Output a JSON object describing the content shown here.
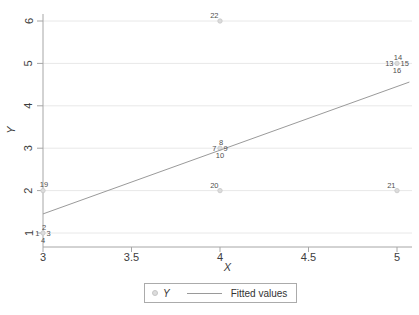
{
  "chart_data": {
    "type": "scatter",
    "title": "",
    "xlabel": "X",
    "ylabel": "Y",
    "x_ticks": [
      3,
      3.5,
      4,
      4.5,
      5
    ],
    "y_ticks": [
      1,
      2,
      3,
      4,
      5,
      6
    ],
    "xlim": [
      3,
      5.09
    ],
    "ylim": [
      0.67,
      6.17
    ],
    "grid": "horizontal-only",
    "legend": {
      "position": "bottom-center",
      "marker_label": "Y",
      "line_label": "Fitted values"
    },
    "points": [
      {
        "label": "1",
        "x": 3,
        "y": 1,
        "label_pos": "left"
      },
      {
        "label": "2",
        "x": 3,
        "y": 1,
        "label_pos": "top"
      },
      {
        "label": "3",
        "x": 3,
        "y": 1,
        "label_pos": "right"
      },
      {
        "label": "4",
        "x": 3,
        "y": 1,
        "label_pos": "bottom"
      },
      {
        "label": "7",
        "x": 4,
        "y": 3,
        "label_pos": "left"
      },
      {
        "label": "8",
        "x": 4,
        "y": 3,
        "label_pos": "top"
      },
      {
        "label": "9",
        "x": 4,
        "y": 3,
        "label_pos": "right"
      },
      {
        "label": "10",
        "x": 4,
        "y": 3,
        "label_pos": "bottom"
      },
      {
        "label": "13",
        "x": 5,
        "y": 5,
        "label_pos": "left"
      },
      {
        "label": "14",
        "x": 5,
        "y": 5,
        "label_pos": "top"
      },
      {
        "label": "15",
        "x": 5,
        "y": 5,
        "label_pos": "right"
      },
      {
        "label": "16",
        "x": 5,
        "y": 5,
        "label_pos": "bottom"
      },
      {
        "label": "19",
        "x": 3,
        "y": 2,
        "label_pos": "top"
      },
      {
        "label": "20",
        "x": 4,
        "y": 2,
        "label_pos": "top-left"
      },
      {
        "label": "21",
        "x": 5,
        "y": 2,
        "label_pos": "top-left"
      },
      {
        "label": "22",
        "x": 4,
        "y": 6,
        "label_pos": "top-left"
      }
    ],
    "fitted_line": {
      "x1": 3,
      "y1": 1.45,
      "x2": 5.07,
      "y2": 4.56
    }
  },
  "colors": {
    "background": "#ffffff",
    "axis": "#a6a6a6",
    "gridline": "#e8e8e8",
    "tick_label": "#3d3d3d",
    "point_label": "#4f4f4f",
    "marker_fill": "#dcdcdc",
    "marker_stroke": "#c6c6c6",
    "fitted_line": "#9a9a9a",
    "legend_border": "#ababab",
    "legend_text": "#333333"
  }
}
